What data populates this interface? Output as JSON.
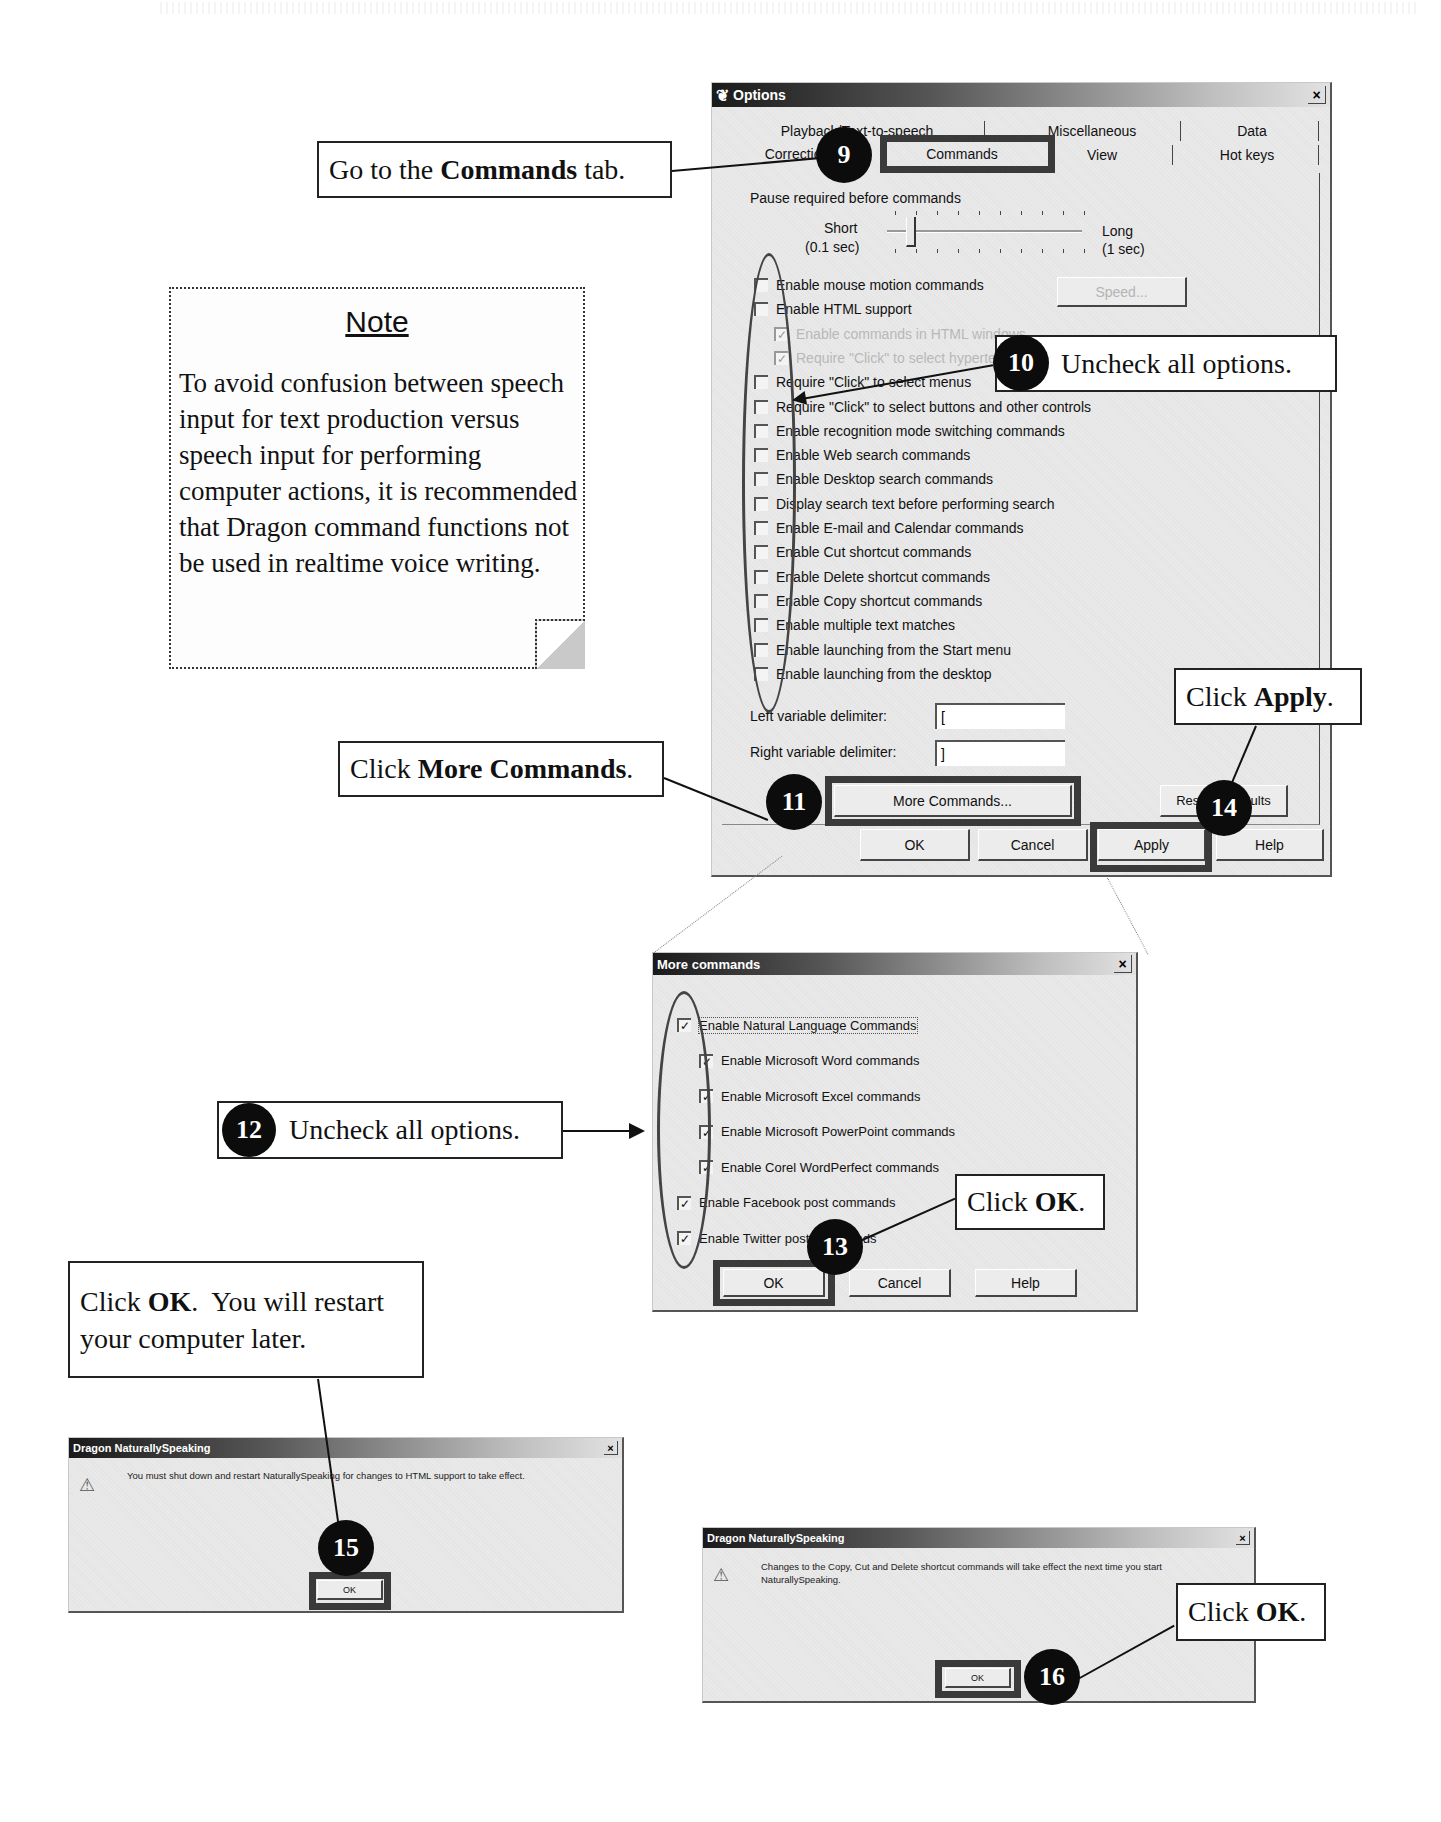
{
  "note": {
    "title": "Note",
    "body": "To avoid confusion between speech input for text production versus speech input for performing computer actions, it is recommended that Dragon command functions not be used in realtime voice writing."
  },
  "callouts": {
    "step9": {
      "badge": "9",
      "pre": "Go to the ",
      "bold": "Commands",
      "post": " tab."
    },
    "step10": {
      "badge": "10",
      "text": "Uncheck all options."
    },
    "step11": {
      "badge": "11",
      "pre": "Click ",
      "bold": "More Commands",
      "post": "."
    },
    "step12": {
      "badge": "12",
      "text": "Uncheck all options."
    },
    "step13": {
      "badge": "13",
      "pre": "Click ",
      "bold": "OK",
      "post": "."
    },
    "step14": {
      "badge": "14",
      "pre": "Click ",
      "bold": "Apply",
      "post": "."
    },
    "step15": {
      "badge": "15",
      "pre": "Click ",
      "bold": "OK",
      "post": ".  You will restart",
      "line2": "your computer later."
    },
    "step16": {
      "badge": "16",
      "pre": "Click ",
      "bold": "OK",
      "post": "."
    }
  },
  "options_dialog": {
    "title": "Options",
    "tabs_row1": [
      "Playback/Text-to-speech",
      "Miscellaneous",
      "Data"
    ],
    "tabs_row2": [
      "Correction",
      "Commands",
      "View",
      "Hot keys"
    ],
    "active_tab": "Commands",
    "pause_label": "Pause required before commands",
    "slider": {
      "min_label": "Short",
      "min_sub": "(0.1 sec)",
      "max_label": "Long",
      "max_sub": "(1 sec)"
    },
    "speed_button": "Speed...",
    "options": [
      {
        "label": "Enable mouse motion commands",
        "checked": false,
        "disabled": false
      },
      {
        "label": "Enable HTML support",
        "checked": false,
        "disabled": false
      },
      {
        "label": "Enable commands in HTML windows",
        "checked": true,
        "disabled": true
      },
      {
        "label": "Require \"Click\" to select hypertext links",
        "checked": true,
        "disabled": true
      },
      {
        "label": "Require \"Click\" to select menus",
        "checked": false,
        "disabled": false
      },
      {
        "label": "Require \"Click\" to select buttons and other controls",
        "checked": false,
        "disabled": false
      },
      {
        "label": "Enable recognition mode switching commands",
        "checked": false,
        "disabled": false
      },
      {
        "label": "Enable Web search commands",
        "checked": false,
        "disabled": false
      },
      {
        "label": "Enable Desktop search commands",
        "checked": false,
        "disabled": false
      },
      {
        "label": "Display search text before performing search",
        "checked": false,
        "disabled": false
      },
      {
        "label": "Enable E-mail and Calendar commands",
        "checked": false,
        "disabled": false
      },
      {
        "label": "Enable Cut shortcut commands",
        "checked": false,
        "disabled": false
      },
      {
        "label": "Enable Delete shortcut commands",
        "checked": false,
        "disabled": false
      },
      {
        "label": "Enable Copy shortcut commands",
        "checked": false,
        "disabled": false
      },
      {
        "label": "Enable multiple text matches",
        "checked": false,
        "disabled": false
      },
      {
        "label": "Enable launching from the Start menu",
        "checked": false,
        "disabled": false
      },
      {
        "label": "Enable launching from the desktop",
        "checked": false,
        "disabled": false
      }
    ],
    "left_delim_label": "Left variable delimiter:",
    "left_delim_value": "[",
    "right_delim_label": "Right variable delimiter:",
    "right_delim_value": "]",
    "more_commands_button": "More Commands...",
    "restore_defaults_button": "Restore defaults",
    "ok_button": "OK",
    "cancel_button": "Cancel",
    "apply_button": "Apply",
    "help_button": "Help"
  },
  "more_commands_dialog": {
    "title": "More commands",
    "options": [
      {
        "label": "Enable Natural Language Commands",
        "checked": true,
        "indent": false
      },
      {
        "label": "Enable Microsoft Word commands",
        "checked": true,
        "indent": true
      },
      {
        "label": "Enable Microsoft Excel commands",
        "checked": true,
        "indent": true
      },
      {
        "label": "Enable Microsoft PowerPoint commands",
        "checked": true,
        "indent": true
      },
      {
        "label": "Enable Corel WordPerfect commands",
        "checked": true,
        "indent": true
      },
      {
        "label": "Enable Facebook post commands",
        "checked": true,
        "indent": false
      },
      {
        "label": "Enable Twitter post commands",
        "checked": true,
        "indent": false
      }
    ],
    "ok_button": "OK",
    "cancel_button": "Cancel",
    "help_button": "Help"
  },
  "restart_dialog": {
    "title": "Dragon NaturallySpeaking",
    "message": "You must shut down and restart NaturallySpeaking for changes to HTML support to take effect.",
    "ok_button": "OK"
  },
  "shortcut_dialog": {
    "title": "Dragon NaturallySpeaking",
    "message": "Changes to the Copy, Cut and Delete shortcut commands will take effect the next time you start NaturallySpeaking.",
    "ok_button": "OK"
  },
  "icons": {
    "check": "✓",
    "close": "✕",
    "warning": "⚠",
    "app": "❦"
  }
}
